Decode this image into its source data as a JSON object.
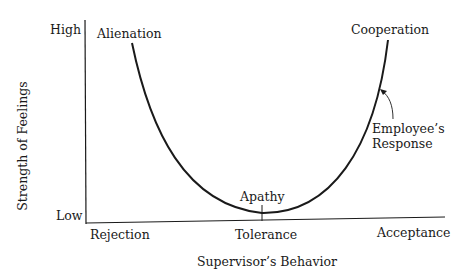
{
  "diagram": {
    "type": "u-curve",
    "y_axis": {
      "title": "Strength of Feelings",
      "high_label": "High",
      "low_label": "Low"
    },
    "x_axis": {
      "title": "Supervisor’s Behavior",
      "ticks": [
        "Rejection",
        "Tolerance",
        "Acceptance"
      ]
    },
    "curve_labels": {
      "left_peak": "Alienation",
      "bottom": "Apathy",
      "right_peak": "Cooperation"
    },
    "annotation": {
      "line1": "Employee’s",
      "line2": "Response"
    },
    "colors": {
      "ink": "#1a1a1a",
      "background": "#ffffff"
    }
  }
}
